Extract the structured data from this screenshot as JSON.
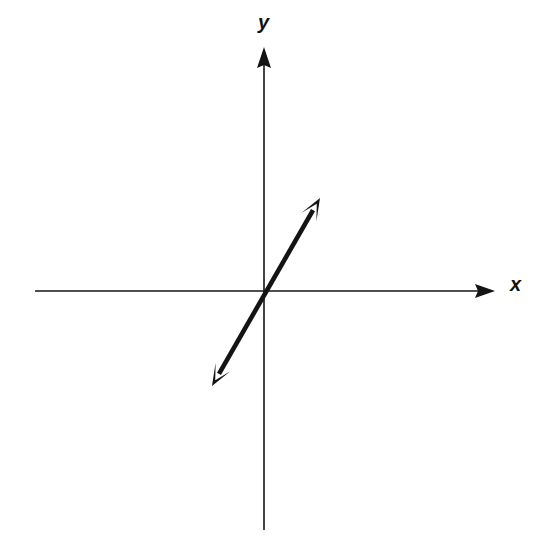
{
  "figure": {
    "background_color": "#ffffff",
    "stroke_color": "#141414",
    "width": 556,
    "height": 550
  },
  "axes": {
    "x_label": "x",
    "y_label": "y",
    "origin": {
      "x": 264,
      "y": 291
    },
    "x_axis": {
      "name": "x-axis",
      "start_x": 35,
      "end_x": 495,
      "y": 291,
      "stroke_width": 1.6,
      "arrow_end": "right"
    },
    "y_axis": {
      "name": "y-axis",
      "x": 264,
      "start_y": 530,
      "end_y": 47,
      "stroke_width": 1.6,
      "arrow_end": "top"
    }
  },
  "chart_data": {
    "type": "line",
    "title": "",
    "xlabel": "x",
    "ylabel": "y",
    "grid": false,
    "legend": "none",
    "origin_px": {
      "x": 264,
      "y": 291
    },
    "series": [
      {
        "name": "line-through-origin",
        "description": "Straight double-headed arrow passing through the origin with positive slope",
        "arrowheads": "both",
        "stroke_width": 4.6,
        "color": "#141414",
        "points_px": [
          {
            "x": 212,
            "y": 386
          },
          {
            "x": 264,
            "y": 291
          },
          {
            "x": 320,
            "y": 198
          }
        ],
        "slope_px": 1.72,
        "passes_through_origin": true,
        "quadrants": [
          "I",
          "III"
        ]
      }
    ]
  },
  "labels": {
    "x": {
      "text": "x",
      "left_px": 510,
      "top_px": 274
    },
    "y": {
      "text": "y",
      "left_px": 258,
      "top_px": 12
    }
  }
}
